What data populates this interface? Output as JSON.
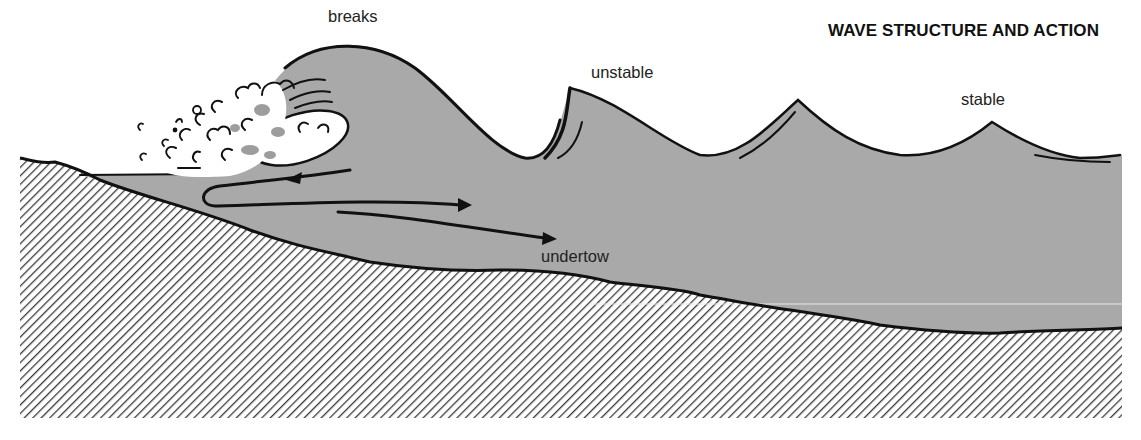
{
  "diagram": {
    "title": "WAVE STRUCTURE AND ACTION",
    "labels": {
      "breaks": "breaks",
      "unstable": "unstable",
      "stable": "stable",
      "undertow": "undertow"
    },
    "colors": {
      "water": "#a9a9a9",
      "seabed_hatch": "#3a3a3a",
      "outline": "#111111",
      "foam": "#ffffff",
      "background": "#ffffff"
    },
    "elements": {
      "waves": [
        "breaking wave",
        "unstable wave",
        "stable wave",
        "stable wave"
      ],
      "arrows": [
        "return flow arrow (left)",
        "undertow arrow (right, upper)",
        "undertow arrow (right, lower)"
      ],
      "seabed": "hatched sloping seabed"
    }
  }
}
